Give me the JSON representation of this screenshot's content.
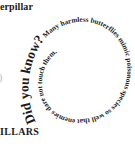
{
  "page": {
    "top_heading_fragment": "erpillar",
    "bottom_heading_fragment": "ILLARS",
    "edge_fragment": ")"
  },
  "spiral": {
    "lead": "Did you know?",
    "body": " Many harmless butterflies mimic poisonous species so well that enemies dare not touch them.",
    "text_color": "#1a1a1a"
  }
}
